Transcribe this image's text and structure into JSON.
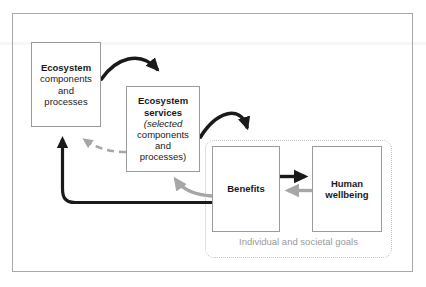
{
  "diagram": {
    "title_text": "",
    "colors": {
      "box_border": "#9b9b9b",
      "frame_border": "#a8a8a8",
      "black_arrow": "#1a1a1a",
      "gray_arrow": "#a6a6a6",
      "dotted_container": "#c0c0c0",
      "goals_label": "#9a9a9a",
      "text": "#1a1a1a",
      "background": "#ffffff"
    },
    "nodes": {
      "ecosystem": {
        "title": "Ecosystem",
        "line2": "components",
        "line3": "and",
        "line4": "processes"
      },
      "ecosystem_services": {
        "title_line1": "Ecosystem",
        "title_line2": "services",
        "line3": "(selected",
        "line4": "components",
        "line5": "and",
        "line6": "processes)"
      },
      "benefits": {
        "title": "Benefits"
      },
      "human_wellbeing": {
        "title_line1": "Human",
        "title_line2": "wellbeing"
      }
    },
    "containers": {
      "goals": {
        "label": "Individual and societal goals"
      }
    },
    "edges": [
      {
        "name": "ecosystem-to-services",
        "from": "ecosystem",
        "to": "ecosystem_services",
        "style": "solid-curved",
        "color": "black",
        "label": ""
      },
      {
        "name": "services-to-benefits",
        "from": "ecosystem_services",
        "to": "benefits",
        "style": "solid-curved",
        "color": "black",
        "label": ""
      },
      {
        "name": "benefits-to-human-wellbeing",
        "from": "benefits",
        "to": "human_wellbeing",
        "style": "solid-straight",
        "color": "black",
        "label": ""
      },
      {
        "name": "human-wellbeing-to-benefits",
        "from": "human_wellbeing",
        "to": "benefits",
        "style": "solid-straight",
        "color": "gray",
        "label": ""
      },
      {
        "name": "benefits-to-ecosystem-feedback",
        "from": "benefits",
        "to": "ecosystem",
        "style": "solid-curved",
        "color": "black",
        "label": ""
      },
      {
        "name": "benefits-to-services-feedback",
        "from": "benefits",
        "to": "ecosystem_services",
        "style": "solid-curved",
        "color": "gray",
        "label": ""
      },
      {
        "name": "services-to-ecosystem-dashed",
        "from": "ecosystem_services",
        "to": "ecosystem",
        "style": "dashed-curved",
        "color": "gray",
        "label": ""
      }
    ]
  }
}
